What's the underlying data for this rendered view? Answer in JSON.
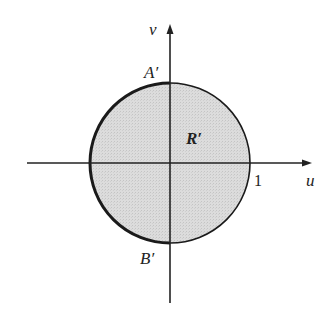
{
  "diagram": {
    "axes": {
      "horizontal_label": "u",
      "vertical_label": "v"
    },
    "region": {
      "label": "R′",
      "shape": "disk",
      "radius_label": "1",
      "fill_color": "#d9d9d9",
      "boundary_thick_side": "left"
    },
    "points": {
      "top": "A′",
      "bottom": "B′"
    }
  }
}
